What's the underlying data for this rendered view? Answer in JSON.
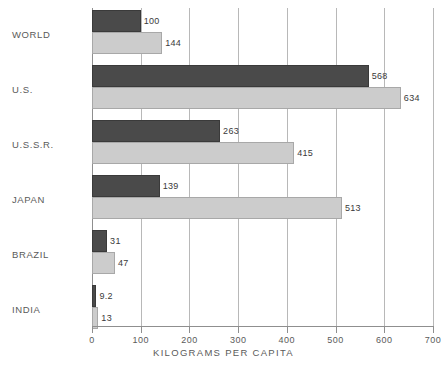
{
  "chart_data": {
    "type": "bar",
    "orientation": "horizontal",
    "title": "",
    "subtitle": "",
    "xlabel": "KILOGRAMS PER CAPITA",
    "ylabel": "",
    "xlim": [
      0,
      700
    ],
    "xticks": [
      0,
      100,
      200,
      300,
      400,
      500,
      600,
      700
    ],
    "xtick_labels": [
      "0",
      "100",
      "200",
      "300",
      "400",
      "500",
      "600",
      "700"
    ],
    "grid": true,
    "legend": "none",
    "categories": [
      "WORLD",
      "U.S.",
      "U.S.S.R.",
      "JAPAN",
      "BRAZIL",
      "INDIA"
    ],
    "series": [
      {
        "name": "dark",
        "color": "#4a4a4a",
        "values": [
          100,
          568,
          263,
          139,
          31,
          9.2
        ],
        "value_labels": [
          "100",
          "568",
          "263",
          "139",
          "31",
          "9.2"
        ]
      },
      {
        "name": "light",
        "color": "#cccccc",
        "values": [
          144,
          634,
          415,
          513,
          47,
          13
        ],
        "value_labels": [
          "144",
          "634",
          "415",
          "513",
          "47",
          "13"
        ]
      }
    ]
  },
  "axis": {
    "x_title": "KILOGRAMS PER CAPITA",
    "ticks": [
      {
        "label": "0",
        "value": 0
      },
      {
        "label": "100",
        "value": 100
      },
      {
        "label": "200",
        "value": 200
      },
      {
        "label": "300",
        "value": 300
      },
      {
        "label": "400",
        "value": 400
      },
      {
        "label": "500",
        "value": 500
      },
      {
        "label": "600",
        "value": 600
      },
      {
        "label": "700",
        "value": 700
      }
    ]
  },
  "categories": [
    {
      "label": "WORLD"
    },
    {
      "label": "U.S."
    },
    {
      "label": "U.S.S.R."
    },
    {
      "label": "JAPAN"
    },
    {
      "label": "BRAZIL"
    },
    {
      "label": "INDIA"
    }
  ],
  "colors": {
    "dark_series": "#4a4a4a",
    "light_series": "#cccccc",
    "grid": "#b8b8b8",
    "axis": "#8f8f8f",
    "text": "#5a5a5a",
    "background": "#ffffff"
  }
}
